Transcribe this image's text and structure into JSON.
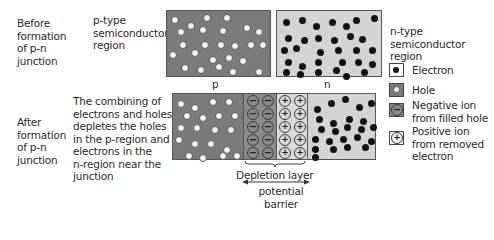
{
  "before": {
    "label": "Before\nformation\nof p-n\njunction",
    "p_region_label": "p-type\nsemiconductor\nregion",
    "n_region_label": "n-type\nsemiconductor\nregion",
    "p_letter": "p",
    "n_letter": "n"
  },
  "after": {
    "label": "After\nformation\nof p-n\njunction",
    "description": "The combining of\nelectrons and holes\ndepletes the holes\nin the p-region and\nelectrons in the\nn-region near the\njunction"
  },
  "depletion": {
    "layer_label": "Depletion layer",
    "barrier_label": "potential\nbarrier",
    "neg_symbol": "−",
    "pos_symbol": "+"
  },
  "legend": {
    "items": [
      {
        "icon": "electron-icon",
        "label": "Electron"
      },
      {
        "icon": "hole-icon",
        "label": "Hole"
      },
      {
        "icon": "negative-ion-icon",
        "label": "Negative ion\nfrom filled hole"
      },
      {
        "icon": "positive-ion-icon",
        "label": "Positive ion\nfrom removed\nelectron"
      }
    ]
  },
  "colors": {
    "p_region": "#7b7b7b",
    "n_region": "#d4d4d4",
    "negative_ion_column": "#8a8a8a",
    "positive_ion_column": "#d9d9d9",
    "electron": "#111111",
    "hole": "#f3f3f3"
  }
}
